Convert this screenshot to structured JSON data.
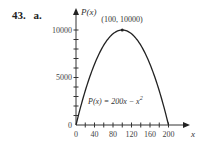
{
  "problem": {
    "number": "43.",
    "part": "a."
  },
  "chart_data": {
    "type": "line",
    "title": "",
    "function": "P(x) = 200x - x^2",
    "xlabel": "x",
    "ylabel": "P(x)",
    "xlim": [
      0,
      200
    ],
    "ylim": [
      0,
      10000
    ],
    "x_ticks": [
      0,
      40,
      80,
      120,
      160,
      200
    ],
    "x_minor_step": 20,
    "y_ticks": [
      0,
      5000,
      10000
    ],
    "y_minor_step": 1000,
    "grid": false,
    "legend": null,
    "series": [
      {
        "name": "P(x) = 200x − x²",
        "x": [
          0,
          20,
          40,
          60,
          80,
          100,
          120,
          140,
          160,
          180,
          200
        ],
        "y": [
          0,
          3600,
          6400,
          8400,
          9600,
          10000,
          9600,
          8400,
          6400,
          3600,
          0
        ]
      }
    ],
    "annotations": [
      {
        "text": "(100, 10000)",
        "x": 100,
        "y": 10000,
        "type": "vertex"
      },
      {
        "text": "P(x) = 200x − x²",
        "type": "equation-label"
      }
    ]
  },
  "labels": {
    "y_axis": "P(x)",
    "x_axis": "x",
    "vertex": "(100, 10000)",
    "equation_main": "P(x) = 200x − x",
    "equation_sup": "2",
    "xt0": "0",
    "xt1": "40",
    "xt2": "80",
    "xt3": "120",
    "xt4": "160",
    "xt5": "200",
    "yt0": "0",
    "yt1": "5000",
    "yt2": "10000"
  }
}
